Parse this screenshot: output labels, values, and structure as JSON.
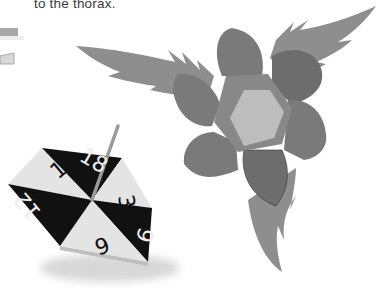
{
  "caption": {
    "text": "to the thorax."
  },
  "spinning_top": {
    "numbers": [
      "18",
      "3",
      "9",
      "6",
      "12",
      "15"
    ],
    "colors": {
      "light": "#e4e4e4",
      "dark": "#111111",
      "stick": "#9a9a9a"
    }
  },
  "flower": {
    "colors": {
      "leaf": "#8e8e8e",
      "petal": "#7a7a7a",
      "petal_dark": "#6d6d6d",
      "ring": "#888888",
      "center": "#bdbdbd"
    }
  },
  "edge_fragment": {
    "colors": {
      "bar_top": "#a8a8a8",
      "bar_bottom": "#d8d8d8"
    }
  }
}
